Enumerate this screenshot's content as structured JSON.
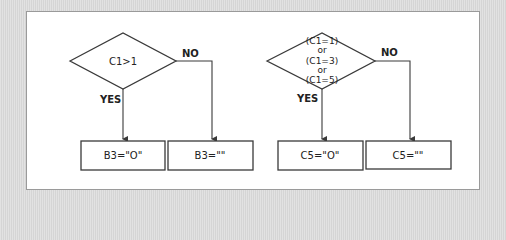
{
  "diagram": {
    "type": "flowchart",
    "colors": {
      "background": "#dcdcdc",
      "panel": "#ffffff",
      "stroke": "#3a3a3a",
      "text": "#222222"
    },
    "flowcharts": [
      {
        "decision": {
          "lines": [
            "C1>1"
          ]
        },
        "yes_label": "YES",
        "no_label": "NO",
        "yes_result": "B3=\"O\"",
        "no_result": "B3=\"\""
      },
      {
        "decision": {
          "lines": [
            "(C1=1)",
            "or",
            "(C1=3)",
            "or",
            "(C1=5)"
          ]
        },
        "yes_label": "YES",
        "no_label": "NO",
        "yes_result": "C5=\"O\"",
        "no_result": "C5=\"\""
      }
    ]
  }
}
